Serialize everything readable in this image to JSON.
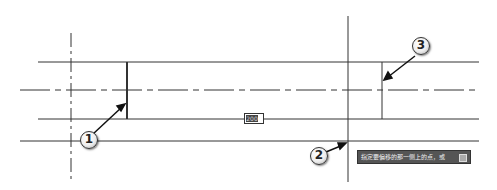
{
  "drawing": {
    "line_color": "#333333",
    "dynamic_input": {
      "value": "200"
    },
    "tooltip": {
      "text": "指定要偏移的那一侧上的点，或",
      "icon": "dropdown-icon"
    }
  },
  "callouts": [
    {
      "label": "1"
    },
    {
      "label": "2"
    },
    {
      "label": "3"
    }
  ]
}
